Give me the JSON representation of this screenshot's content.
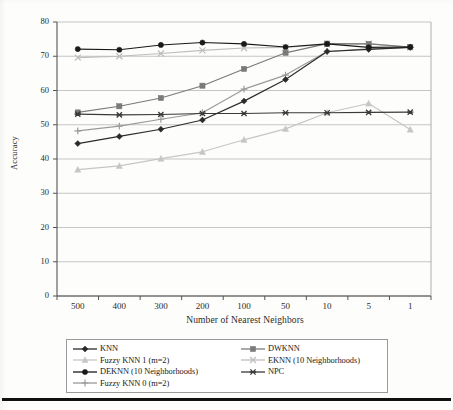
{
  "chart_data": {
    "type": "line",
    "title": "",
    "xlabel": "Number of Nearest Neighbors",
    "ylabel": "Accuracy",
    "categories": [
      "500",
      "400",
      "300",
      "200",
      "100",
      "50",
      "10",
      "5",
      "1"
    ],
    "x_tick_labels": [
      "500",
      "400",
      "300",
      "200",
      "100",
      "50",
      "10",
      "5",
      "1"
    ],
    "y_tick_labels": [
      "0",
      "10",
      "20",
      "30",
      "40",
      "50",
      "60",
      "70",
      "80"
    ],
    "ylim": [
      0,
      80
    ],
    "y_major_step": 10,
    "grid": "horizontal",
    "legend_position": "bottom",
    "series": [
      {
        "name": "KNN",
        "marker": "diamond",
        "color": "#2b2b2b",
        "values": [
          44.5,
          46.6,
          48.7,
          51.4,
          56.9,
          63.2,
          71.4,
          72.0,
          72.6
        ]
      },
      {
        "name": "DWKNN",
        "marker": "square",
        "color": "#7a7a7a",
        "values": [
          53.6,
          55.4,
          57.8,
          61.4,
          66.3,
          71.0,
          73.7,
          73.6,
          72.7
        ]
      },
      {
        "name": "Fuzzy KNN 1 (m=2)",
        "marker": "triangle",
        "color": "#c6c6c6",
        "values": [
          36.9,
          38.0,
          40.1,
          42.1,
          45.6,
          48.8,
          53.5,
          56.2,
          48.6
        ]
      },
      {
        "name": "EKNN (10 Neighborhoods)",
        "marker": "cross-x",
        "color": "#bdbdbd",
        "values": [
          69.6,
          70.0,
          70.8,
          71.7,
          72.4,
          72.6,
          73.5,
          73.7,
          72.6
        ]
      },
      {
        "name": "DEKNN (10 Neighborhoods)",
        "marker": "circle",
        "color": "#1a1a1a",
        "values": [
          72.1,
          71.9,
          73.3,
          74.0,
          73.6,
          72.7,
          73.6,
          72.6,
          72.7
        ]
      },
      {
        "name": "NPC",
        "marker": "asterisk",
        "color": "#3a3a3a",
        "values": [
          53.1,
          52.9,
          53.0,
          53.3,
          53.3,
          53.5,
          53.5,
          53.6,
          53.7
        ]
      },
      {
        "name": "Fuzzy KNN 0 (m=2)",
        "marker": "plus",
        "color": "#9a9a9a",
        "values": [
          48.2,
          49.6,
          51.6,
          53.5,
          60.4,
          64.5,
          71.4,
          72.2,
          72.6
        ]
      }
    ]
  },
  "legend": {
    "entries": [
      {
        "label": "KNN",
        "marker": "diamond",
        "color": "#2b2b2b"
      },
      {
        "label": "DWKNN",
        "marker": "square",
        "color": "#7a7a7a"
      },
      {
        "label": "Fuzzy KNN 1 (m=2)",
        "marker": "triangle",
        "color": "#c6c6c6"
      },
      {
        "label": "EKNN (10 Neighborhoods)",
        "marker": "cross-x",
        "color": "#bdbdbd"
      },
      {
        "label": "DEKNN (10 Neighborhoods)",
        "marker": "circle",
        "color": "#1a1a1a"
      },
      {
        "label": "NPC",
        "marker": "asterisk",
        "color": "#3a3a3a"
      },
      {
        "label": "Fuzzy KNN 0 (m=2)",
        "marker": "plus",
        "color": "#9a9a9a"
      }
    ]
  }
}
